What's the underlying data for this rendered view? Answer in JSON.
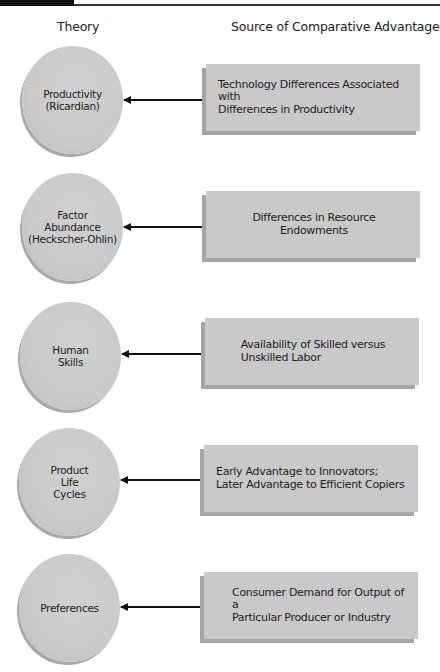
{
  "header": {
    "theory_label": "Theory",
    "source_label": "Source of Comparative Advantage"
  },
  "rows": [
    {
      "theory": "Productivity\n(Ricardian)",
      "source": "Technology Differences Associated with\nDifferences in Productivity"
    },
    {
      "theory": "Factor\nAbundance\n(Heckscher-Ohlin)",
      "source": "Differences in Resource Endowments"
    },
    {
      "theory": "Human\nSkills",
      "source": "Availability of Skilled versus\nUnskilled Labor"
    },
    {
      "theory": "Product\nLife\nCycles",
      "source": "Early Advantage to Innovators;\nLater Advantage to Efficient Copiers"
    },
    {
      "theory": "Preferences",
      "source": "Consumer Demand for Output of a\nParticular Producer or Industry"
    }
  ],
  "colors": {
    "shape_fill": "#c9c9c9",
    "shape_edge": "#a5a5a5",
    "arrow": "#111111"
  }
}
